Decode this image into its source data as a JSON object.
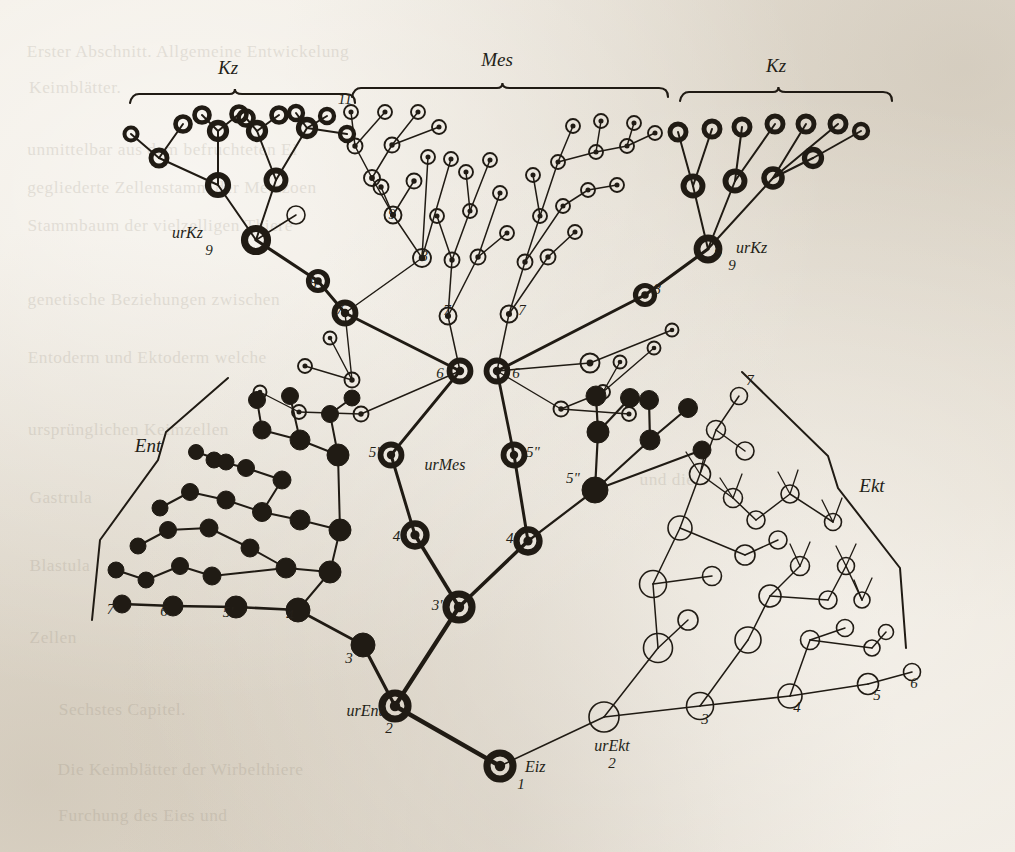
{
  "figure": {
    "kind": "cell-lineage-tree",
    "ink_color": "#201b14",
    "paper_color": "#efeae1"
  },
  "group_labels": [
    {
      "name": "kz-left",
      "text": "Kz",
      "x": 228,
      "y": 74
    },
    {
      "name": "mes",
      "text": "Mes",
      "x": 497,
      "y": 66
    },
    {
      "name": "kz-right",
      "text": "Kz",
      "x": 776,
      "y": 72
    },
    {
      "name": "ent",
      "text": "Ent",
      "x": 148,
      "y": 452
    },
    {
      "name": "ekt",
      "text": "Ekt",
      "x": 872,
      "y": 492
    }
  ],
  "named_nodes": [
    {
      "name": "ur-kz-left",
      "text": "urKz",
      "x": 203,
      "y": 238,
      "anchor": "end",
      "number": "9"
    },
    {
      "name": "ur-kz-right",
      "text": "urKz",
      "x": 736,
      "y": 253,
      "anchor": "start",
      "number": "9"
    },
    {
      "name": "ur-mes",
      "text": "urMes",
      "x": 445,
      "y": 470,
      "anchor": "middle",
      "number": ""
    },
    {
      "name": "ur-ent",
      "text": "urEnt",
      "x": 383,
      "y": 716,
      "anchor": "end",
      "number": "2"
    },
    {
      "name": "ur-ekt",
      "text": "urEkt",
      "x": 612,
      "y": 751,
      "anchor": "middle",
      "number": "2"
    },
    {
      "name": "eiz",
      "text": "Eiz",
      "x": 525,
      "y": 772,
      "anchor": "start",
      "number": "1"
    }
  ],
  "number_labels": [
    {
      "name": "n-ent-7p",
      "text": "7'",
      "x": 112,
      "y": 614
    },
    {
      "name": "n-ent-6",
      "text": "6",
      "x": 164,
      "y": 616
    },
    {
      "name": "n-ent-5p",
      "text": "5'",
      "x": 228,
      "y": 617
    },
    {
      "name": "n-ent-4",
      "text": "4",
      "x": 290,
      "y": 620
    },
    {
      "name": "n-ent-3",
      "text": "3",
      "x": 349,
      "y": 663
    },
    {
      "name": "n-mes-3p",
      "text": "3'",
      "x": 437,
      "y": 610
    },
    {
      "name": "n-mes-4p",
      "text": "4'",
      "x": 398,
      "y": 541
    },
    {
      "name": "n-mes-4s",
      "text": "4\"",
      "x": 513,
      "y": 543
    },
    {
      "name": "n-mes-5p",
      "text": "5'",
      "x": 374,
      "y": 457
    },
    {
      "name": "n-mes-5s",
      "text": "5\"",
      "x": 533,
      "y": 457
    },
    {
      "name": "n-ent-5s",
      "text": "5\"",
      "x": 573,
      "y": 483
    },
    {
      "name": "n-mes-6a",
      "text": "6",
      "x": 440,
      "y": 378
    },
    {
      "name": "n-mes-6b",
      "text": "6",
      "x": 516,
      "y": 378
    },
    {
      "name": "n-mes-7a",
      "text": "7",
      "x": 447,
      "y": 315
    },
    {
      "name": "n-mes-7b",
      "text": "7",
      "x": 522,
      "y": 315
    },
    {
      "name": "n-mes-7c",
      "text": "7",
      "x": 340,
      "y": 314
    },
    {
      "name": "n-mes-8a",
      "text": "8",
      "x": 424,
      "y": 261
    },
    {
      "name": "n-mes-9a",
      "text": "9",
      "x": 392,
      "y": 219
    },
    {
      "name": "n-mes-11",
      "text": "11",
      "x": 345,
      "y": 104
    },
    {
      "name": "n-kzl-8",
      "text": "8",
      "x": 313,
      "y": 288
    },
    {
      "name": "n-kzr-8",
      "text": "8",
      "x": 657,
      "y": 294
    },
    {
      "name": "n-kzr-9",
      "text": "9",
      "x": 718,
      "y": 258
    },
    {
      "name": "n-ekt-3",
      "text": "3",
      "x": 705,
      "y": 724
    },
    {
      "name": "n-ekt-4",
      "text": "4",
      "x": 797,
      "y": 712
    },
    {
      "name": "n-ekt-5",
      "text": "5",
      "x": 877,
      "y": 700
    },
    {
      "name": "n-ekt-6",
      "text": "6",
      "x": 914,
      "y": 688
    },
    {
      "name": "n-ekt-7",
      "text": "7",
      "x": 750,
      "y": 385
    }
  ],
  "ghost_text_lines": [
    {
      "x": 30,
      "y": 42,
      "size": 17,
      "text": "Erster Abschnitt.   Allgemeine Entwickelung"
    },
    {
      "x": 30,
      "y": 78,
      "size": 17,
      "text": "Keimblätter."
    },
    {
      "x": 30,
      "y": 140,
      "size": 17,
      "text": "unmittelbar aus dem  befruchteten  Ei"
    },
    {
      "x": 30,
      "y": 178,
      "size": 17,
      "text": "gegliederte Zellenstamm  der  Metazoen"
    },
    {
      "x": 30,
      "y": 216,
      "size": 17,
      "text": "Stammbaum  der  vielzelligen  Thiere"
    },
    {
      "x": 30,
      "y": 290,
      "size": 17,
      "text": "genetische  Beziehungen  zwischen"
    },
    {
      "x": 30,
      "y": 348,
      "size": 17,
      "text": "Entoderm  und  Ektoderm  welche"
    },
    {
      "x": 30,
      "y": 420,
      "size": 17,
      "text": "ursprünglichen  Keimzellen"
    },
    {
      "x": 30,
      "y": 488,
      "size": 17,
      "text": "Gastrula"
    },
    {
      "x": 640,
      "y": 470,
      "size": 17,
      "text": "und die"
    },
    {
      "x": 30,
      "y": 556,
      "size": 17,
      "text": "Blastula"
    },
    {
      "x": 30,
      "y": 628,
      "size": 17,
      "text": "Zellen"
    },
    {
      "x": 60,
      "y": 700,
      "size": 17,
      "text": "Sechstes  Capitel."
    },
    {
      "x": 60,
      "y": 760,
      "size": 17,
      "text": "Die Keimblätter der Wirbelthiere"
    },
    {
      "x": 60,
      "y": 806,
      "size": 17,
      "text": "Furchung  des  Eies  und"
    }
  ],
  "node_styles": {
    "solid": "filled black disc (entoderm)",
    "hollow": "open circle, thin outline (ectoderm)",
    "dotted": "open circle with central black dot (mesoderm)",
    "thick_ring": "heavy open ring (germ cells / Keimzellen)",
    "thick_dot": "heavy ring with central black dot (stem cells)"
  }
}
